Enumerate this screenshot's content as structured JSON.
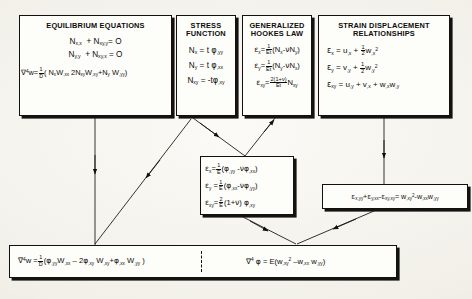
{
  "diagram": {
    "background_color": "#f4f2ec",
    "ink_color": "#0d0c0a"
  },
  "boxes": {
    "equilibrium": {
      "header_line1": "EQUILIBRIUM EQUATIONS",
      "equations": [
        "N_x,x + N_xy,y = 0",
        "N_y,y + N_xy,x = 0",
        "∇⁴w = (1/D)(N_x w,xx + 2N_xy w,xy + N_y w,yy)"
      ]
    },
    "stress_function": {
      "header_line1": "STRESS",
      "header_line2": "FUNCTION",
      "equations": [
        "N_x = t φ,yy",
        "N_y = t φ,xx",
        "N_xy = -t φ,xy"
      ]
    },
    "hookes_law": {
      "header_line1": "GENERALIZED",
      "header_line2": "HOOKES  LAW",
      "equations": [
        "ε_x = (1/Et)(N_x - νN_y)",
        "ε_y = (1/Et)(N_y - νN_x)",
        "ε_xy = (2(1+ν)/Et) N_xy"
      ]
    },
    "strain_displacement": {
      "header_line1": "STRAIN DISPLACEMENT",
      "header_line2": "RELATIONSHIPS",
      "equations": [
        "ε_x = u,x + (1/2) w,x²",
        "ε_y = v,y + (1/2) w,y²",
        "ε_xy = u,y + v,x + w,x w,y"
      ]
    },
    "strain_stress_function": {
      "equations": [
        "ε_x = (1/E)(φ,yy - νφ,xx)",
        "ε_y = (1/E)(φ,xx - νφ,yy)",
        "ε_xy = (2/E)(1+ν) φ,xy"
      ]
    },
    "compatibility": {
      "equation": "ε_x,yy + ε_y,xx - ε_xy,xy = w,xy² - w,xx w,yy"
    },
    "governing": {
      "equation_left": "∇⁴w = (1/D)(φ,yy w,xx - 2φ,xy w,xy + φ,xx w,yy)",
      "equation_right": "∇⁴φ = E(w,xy² - w,xx w,yy)"
    }
  },
  "symbols": {
    "nabla4": "∇",
    "phi": "φ",
    "epsilon": "ε",
    "nu": "ν",
    "zero": "O",
    "one": "1",
    "two": "2",
    "E": "E",
    "Et": "Et",
    "D": "D",
    "power4": "4",
    "power2": "2",
    "plus": "+",
    "minus": "−",
    "equals": "=",
    "lparen": "(",
    "rparen": ")"
  },
  "connectors": [
    {
      "name": "equilibrium-to-governing",
      "from": "equilibrium",
      "to": "governing"
    },
    {
      "name": "stress-function-to-strain-stress",
      "from": "stress_function",
      "to": "strain_stress_function"
    },
    {
      "name": "hookes-law-to-strain-stress",
      "from": "hookes_law",
      "to": "strain_stress_function"
    },
    {
      "name": "stress-function-to-governing",
      "from": "stress_function",
      "to": "governing"
    },
    {
      "name": "strain-displacement-to-compatibility",
      "from": "strain_displacement",
      "to": "compatibility"
    },
    {
      "name": "strain-stress-to-governing",
      "from": "strain_stress_function",
      "to": "governing"
    },
    {
      "name": "compatibility-to-governing",
      "from": "compatibility",
      "to": "governing"
    }
  ]
}
